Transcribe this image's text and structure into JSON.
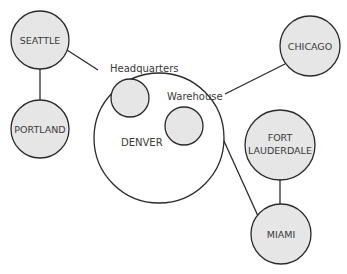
{
  "diagram": {
    "type": "network-topology",
    "hub": {
      "label": "DENVER",
      "sub_sites": [
        {
          "label": "Headquarters"
        },
        {
          "label": "Warehouse"
        }
      ]
    },
    "sites": [
      {
        "id": "seattle",
        "label": "SEATTLE"
      },
      {
        "id": "portland",
        "label": "PORTLAND"
      },
      {
        "id": "chicago",
        "label": "CHICAGO"
      },
      {
        "id": "fort_lauderdale",
        "label_line1": "FORT",
        "label_line2": "LAUDERDALE"
      },
      {
        "id": "miami",
        "label": "MIAMI"
      }
    ],
    "links": [
      {
        "from": "SEATTLE",
        "to": "DENVER"
      },
      {
        "from": "SEATTLE",
        "to": "PORTLAND"
      },
      {
        "from": "DENVER",
        "to": "CHICAGO"
      },
      {
        "from": "DENVER",
        "to": "MIAMI"
      },
      {
        "from": "FORT LAUDERDALE",
        "to": "MIAMI"
      }
    ],
    "colors": {
      "site_fill": "#e6e6e6",
      "hub_fill": "#ffffff",
      "stroke": "#2a2a2a",
      "text": "#3a3a3a"
    }
  }
}
